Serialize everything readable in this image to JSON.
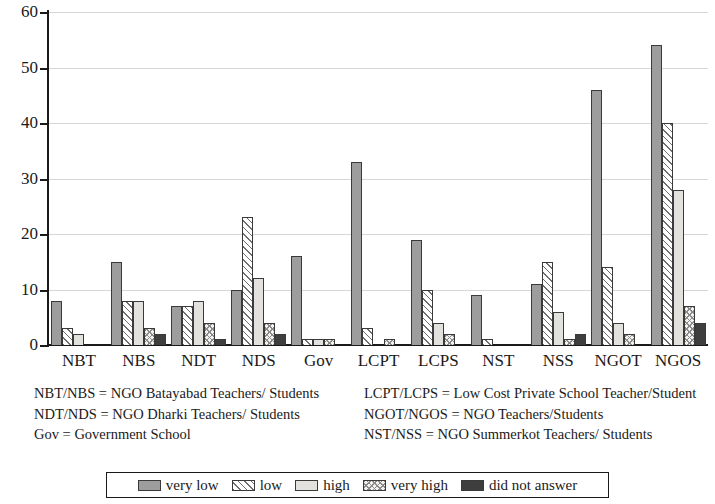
{
  "chart_data": {
    "type": "bar",
    "title": "",
    "xlabel": "",
    "ylabel": "",
    "ylim": [
      0,
      60
    ],
    "ytick_values": [
      0,
      10,
      20,
      30,
      40,
      50,
      60
    ],
    "ytick_labels": [
      "0",
      "10",
      "20",
      "30",
      "40",
      "50",
      "60"
    ],
    "grid": true,
    "legend_position": "bottom",
    "categories": [
      "NBT",
      "NBS",
      "NDT",
      "NDS",
      "Gov",
      "LCPT",
      "LCPS",
      "NST",
      "NSS",
      "NGOT",
      "NGOS"
    ],
    "series": [
      {
        "name": "very low",
        "color": "#9d9d9d",
        "pattern": "solid-gray",
        "values": [
          8,
          15,
          7,
          10,
          16,
          33,
          19,
          9,
          11,
          46,
          54
        ]
      },
      {
        "name": "low",
        "color": "#ffffff",
        "pattern": "diagonal-hatch",
        "values": [
          3,
          8,
          7,
          23,
          1,
          3,
          10,
          1,
          15,
          14,
          40
        ]
      },
      {
        "name": "high",
        "color": "#e2e1de",
        "pattern": "light-solid",
        "values": [
          2,
          8,
          8,
          12,
          1,
          0,
          4,
          0,
          6,
          4,
          28
        ]
      },
      {
        "name": "very high",
        "color": "#f3f2ef",
        "pattern": "cross-hatch",
        "values": [
          0,
          3,
          4,
          4,
          1,
          1,
          2,
          0,
          1,
          2,
          7
        ]
      },
      {
        "name": "did not answer",
        "color": "#3e3e3e",
        "pattern": "solid-dark",
        "values": [
          0,
          2,
          1,
          2,
          0,
          0,
          0,
          0,
          2,
          0,
          4
        ]
      }
    ]
  },
  "legend": {
    "entries": [
      {
        "label": "very low"
      },
      {
        "label": "low"
      },
      {
        "label": "high"
      },
      {
        "label": "very high"
      },
      {
        "label": "did not answer"
      }
    ]
  },
  "footnotes": {
    "left": [
      "NBT/NBS = NGO Batayabad Teachers/ Students",
      "NDT/NDS = NGO Dharki Teachers/ Students",
      "Gov = Government School"
    ],
    "right": [
      "LCPT/LCPS = Low Cost Private School Teacher/Student",
      "NGOT/NGOS = NGO Teachers/Students",
      "NST/NSS = NGO Summerkot Teachers/ Students"
    ]
  }
}
